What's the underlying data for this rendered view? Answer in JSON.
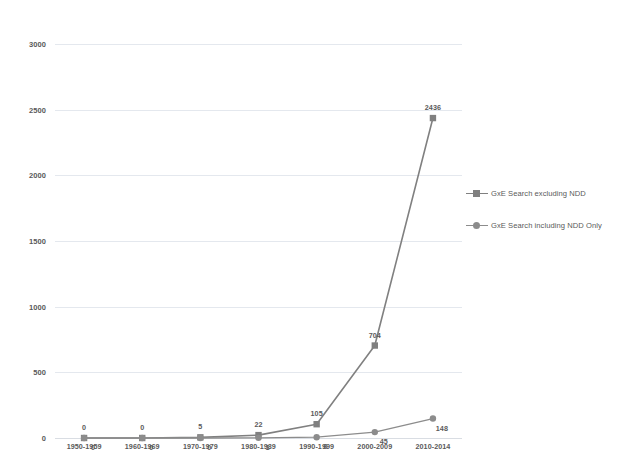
{
  "chart_data": {
    "type": "line",
    "title": "",
    "xlabel": "",
    "ylabel": "",
    "ylim": [
      0,
      3000
    ],
    "yticks": [
      0,
      500,
      1000,
      1500,
      2000,
      2500,
      3000
    ],
    "ytick_labels": [
      "0",
      "500",
      "1000",
      "1500",
      "2000",
      "2500",
      "3000"
    ],
    "grid": true,
    "legend_position": "right",
    "categories": [
      "1950-1959",
      "1960-1969",
      "1970-1979",
      "1980-1989",
      "1990-1999",
      "2000-2009",
      "2010-2014"
    ],
    "series": [
      {
        "name": "GxE Search excluding NDD",
        "marker": "square",
        "color": "#808080",
        "values": [
          0,
          0,
          5,
          22,
          105,
          704,
          2436
        ],
        "data_labels": [
          "0",
          "0",
          "5",
          "22",
          "105",
          "704",
          "2436"
        ]
      },
      {
        "name": "GxE Search including NDD Only",
        "marker": "circle",
        "color": "#8c8c8c",
        "values": [
          0,
          0,
          0,
          1,
          6,
          45,
          148
        ],
        "data_labels": [
          "0",
          "0",
          "0",
          "1",
          "6",
          "45",
          "148"
        ]
      }
    ]
  },
  "style": {
    "gridline_color": "#e4e8ee",
    "text_color": "#595959",
    "background": "#ffffff"
  }
}
